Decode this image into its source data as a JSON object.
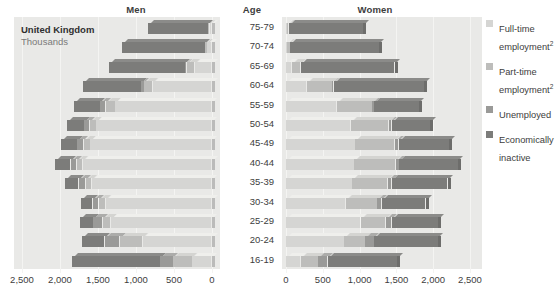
{
  "headers": {
    "men": "Men",
    "age": "Age",
    "women": "Women"
  },
  "caption": {
    "country": "United Kingdom",
    "units": "Thousands"
  },
  "legend": {
    "items": [
      {
        "label": "Full-time employment",
        "sup": "2",
        "color": "#d5d5d3",
        "key": "full_time"
      },
      {
        "label": "Part-time employment",
        "sup": "2",
        "color": "#bdbdbb",
        "key": "part_time"
      },
      {
        "label": "Unemployed",
        "sup": "",
        "color": "#9a9a98",
        "key": "unemployed"
      },
      {
        "label": "Economically inactive",
        "sup": "",
        "color": "#7c7c7a",
        "key": "inactive"
      }
    ]
  },
  "chart_data": {
    "type": "bar",
    "title": "United Kingdom",
    "subtitle": "Thousands",
    "xlabel": "Thousands",
    "ylabel": "Age",
    "grid": true,
    "legend_position": "right",
    "orientation": "horizontal-population-pyramid",
    "xlim": [
      0,
      2500
    ],
    "xticks_left": [
      "2,500",
      "2,000",
      "1,500",
      "1,000",
      "500",
      "0"
    ],
    "xticks_right": [
      "0",
      "500",
      "1,000",
      "1,500",
      "2,000",
      "2,500"
    ],
    "categories": [
      "75-79",
      "70-74",
      "65-69",
      "60-64",
      "55-59",
      "50-54",
      "45-49",
      "40-44",
      "35-39",
      "30-34",
      "25-29",
      "20-24",
      "16-19"
    ],
    "stack_order_men": [
      "full_time",
      "part_time",
      "unemployed",
      "inactive"
    ],
    "stack_order_women": [
      "full_time",
      "part_time",
      "unemployed",
      "inactive"
    ],
    "series": [
      {
        "name": "Full-time employment",
        "key": "full_time",
        "color": "#d5d5d3",
        "men": [
          30,
          60,
          230,
          780,
          1270,
          1520,
          1600,
          1700,
          1580,
          1400,
          1330,
          910,
          260
        ],
        "women": [
          10,
          20,
          80,
          280,
          690,
          880,
          940,
          930,
          900,
          810,
          1020,
          790,
          200
        ]
      },
      {
        "name": "Part-time employment",
        "key": "part_time",
        "color": "#bdbdbb",
        "men": [
          20,
          30,
          100,
          110,
          130,
          90,
          90,
          80,
          80,
          90,
          110,
          300,
          250
        ],
        "women": [
          30,
          40,
          120,
          350,
          480,
          520,
          540,
          560,
          480,
          430,
          340,
          290,
          240
        ]
      },
      {
        "name": "Unemployed",
        "key": "unemployed",
        "color": "#9a9a98",
        "men": [
          0,
          0,
          20,
          40,
          70,
          70,
          80,
          80,
          90,
          80,
          120,
          200,
          170
        ],
        "women": [
          0,
          0,
          10,
          20,
          30,
          40,
          50,
          50,
          60,
          60,
          80,
          120,
          130
        ]
      },
      {
        "name": "Economically inactive",
        "key": "inactive",
        "color": "#7c7c7a",
        "men": [
          790,
          1090,
          1000,
          770,
          340,
          230,
          220,
          200,
          180,
          150,
          180,
          300,
          1160
        ],
        "women": [
          1010,
          1210,
          1270,
          1230,
          610,
          520,
          690,
          800,
          760,
          600,
          630,
          870,
          940
        ]
      }
    ]
  }
}
